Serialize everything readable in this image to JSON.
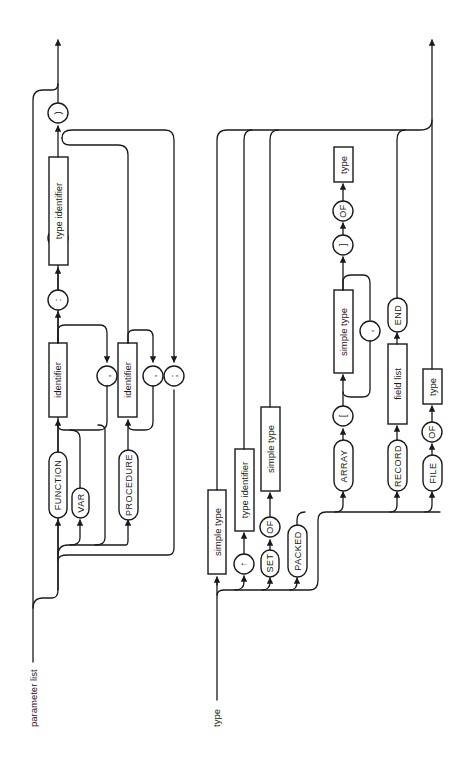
{
  "diagrams": {
    "parameter_list": {
      "title": "parameter list",
      "open_paren": "(",
      "close_paren": ")",
      "function_kw": "FUNCTION",
      "var_kw": "VAR",
      "procedure_kw": "PROCEDURE",
      "identifier_1": "identifier",
      "identifier_2": "identifier",
      "comma_1": ",",
      "comma_2": ",",
      "semicolon": ";",
      "colon": ":",
      "type_identifier": "type identifier"
    },
    "type": {
      "title": "type",
      "simple_type_1": "simple type",
      "pointer_symbol": "↑",
      "type_identifier": "type identifier",
      "set_kw": "SET",
      "of_kw_set": "OF",
      "simple_type_set": "simple type",
      "packed_kw": "PACKED",
      "array_kw": "ARRAY",
      "open_bracket": "[",
      "simple_type_array": "simple type",
      "comma": ",",
      "close_bracket": "]",
      "of_kw_array": "OF",
      "array_element_type": "type",
      "record_kw": "RECORD",
      "field_list": "field list",
      "end_kw": "END",
      "file_kw": "FILE",
      "of_kw_file": "OF",
      "file_element_type": "type"
    }
  },
  "colors": {
    "ink": "#1a1a1a",
    "background": "#ffffff"
  }
}
